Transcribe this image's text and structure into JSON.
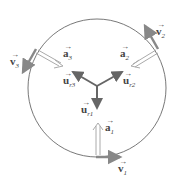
{
  "diagram": {
    "colors": {
      "circle": "#555555",
      "velocity": "#888888",
      "acceleration": "#aaaaaa",
      "unit_vector": "#666666"
    },
    "labels": {
      "v1": {
        "base": "v",
        "sub": "1"
      },
      "v2": {
        "base": "v",
        "sub": "2"
      },
      "v3": {
        "base": "v",
        "sub": "3"
      },
      "a1": {
        "base": "a",
        "sub": "1"
      },
      "a2": {
        "base": "a",
        "sub": "2"
      },
      "a3": {
        "base": "a",
        "sub": "3"
      },
      "ur1": {
        "base": "u",
        "sub": "r1"
      },
      "ur2": {
        "base": "u",
        "sub": "r2"
      },
      "ur3": {
        "base": "u",
        "sub": "r3"
      }
    },
    "arrow_glyph": "→"
  }
}
